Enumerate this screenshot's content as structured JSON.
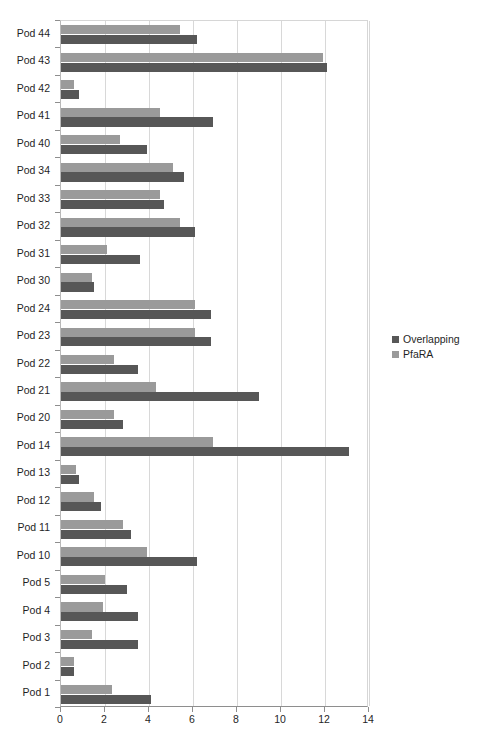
{
  "chart_data": {
    "type": "bar",
    "orientation": "horizontal",
    "title": "",
    "subtitle": "",
    "xlabel": "",
    "ylabel": "",
    "xlim": [
      0,
      14
    ],
    "xticks": [
      0,
      2,
      4,
      6,
      8,
      10,
      12,
      14
    ],
    "xtick_labels": [
      "0",
      "2",
      "4",
      "6",
      "8",
      "10",
      "12",
      "14"
    ],
    "grid": "vertical",
    "legend_position": "right",
    "categories": [
      "Pod 44",
      "Pod 43",
      "Pod 42",
      "Pod 41",
      "Pod 40",
      "Pod 34",
      "Pod 33",
      "Pod 32",
      "Pod 31",
      "Pod 30",
      "Pod 24",
      "Pod 23",
      "Pod 22",
      "Pod 21",
      "Pod 20",
      "Pod 14",
      "Pod 13",
      "Pod 12",
      "Pod 11",
      "Pod 10",
      "Pod 5",
      "Pod 4",
      "Pod 3",
      "Pod 2",
      "Pod 1"
    ],
    "series": [
      {
        "name": "Overlapping",
        "color": "#575757",
        "values": [
          6.2,
          12.1,
          0.8,
          6.9,
          3.9,
          5.6,
          4.7,
          6.1,
          3.6,
          1.5,
          6.8,
          6.8,
          3.5,
          9.0,
          2.8,
          13.1,
          0.8,
          1.8,
          3.2,
          6.2,
          3.0,
          3.5,
          3.5,
          0.6,
          4.1
        ]
      },
      {
        "name": "PfaRA",
        "color": "#9a9a9a",
        "values": [
          5.4,
          11.9,
          0.6,
          4.5,
          2.7,
          5.1,
          4.5,
          5.4,
          2.1,
          1.4,
          6.1,
          6.1,
          2.4,
          4.3,
          2.4,
          6.9,
          0.7,
          1.5,
          2.8,
          3.9,
          2.0,
          1.9,
          1.4,
          0.6,
          2.3
        ]
      }
    ]
  },
  "legend": {
    "items": [
      {
        "label": "Overlapping",
        "color": "#575757"
      },
      {
        "label": "PfaRA",
        "color": "#9a9a9a"
      }
    ]
  }
}
